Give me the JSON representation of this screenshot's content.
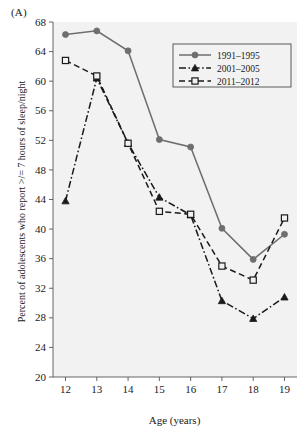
{
  "figure": {
    "panel_label": "(A)",
    "background_color": "#ffffff",
    "plot_background_color": "#f2f2f2"
  },
  "chart_data": {
    "type": "line",
    "title": "",
    "panel": "(A)",
    "xlabel": "Age (years)",
    "ylabel": "Percent of adolescents who report >/= 7 hours of sleep/night",
    "x": [
      12,
      13,
      14,
      15,
      16,
      17,
      18,
      19
    ],
    "xtick_labels": [
      "12",
      "13",
      "14",
      "15",
      "16",
      "17",
      "18",
      "19"
    ],
    "ytick_labels": [
      "20",
      "24",
      "28",
      "32",
      "36",
      "40",
      "44",
      "48",
      "52",
      "56",
      "60",
      "64",
      "68"
    ],
    "ytick_values": [
      20,
      24,
      28,
      32,
      36,
      40,
      44,
      48,
      52,
      56,
      60,
      64,
      68
    ],
    "xlim": [
      11.6,
      19.4
    ],
    "ylim": [
      20,
      68
    ],
    "grid": false,
    "legend_position": "top-right",
    "series": [
      {
        "name": "1991-1995",
        "label": "1991–1995",
        "values": [
          66.3,
          66.8,
          64.1,
          52.1,
          51.1,
          40.1,
          35.9,
          39.3
        ],
        "color": "#6e6e6e",
        "line_style": "solid",
        "marker": "circle"
      },
      {
        "name": "2001-2005",
        "label": "2001–2005",
        "values": [
          43.8,
          60.4,
          51.6,
          44.3,
          41.9,
          30.3,
          27.9,
          30.8
        ],
        "color": "#1a1a1a",
        "line_style": "dash-dot",
        "marker": "triangle"
      },
      {
        "name": "2011-2012",
        "label": "2011–2012",
        "values": [
          62.8,
          60.7,
          51.6,
          42.4,
          42.0,
          35.0,
          33.1,
          41.5
        ],
        "color": "#1a1a1a",
        "line_style": "dashed",
        "marker": "square-open"
      }
    ]
  }
}
